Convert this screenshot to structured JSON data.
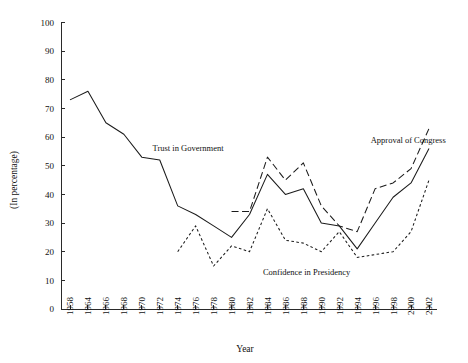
{
  "chart_data": {
    "type": "line",
    "title": "",
    "xlabel": "Year",
    "ylabel": "(In percentage)",
    "ylim": [
      0,
      100
    ],
    "ytick_step": 10,
    "grid": false,
    "legend_position": "inline-annotations",
    "yticks": [
      "0",
      "10",
      "20",
      "30",
      "40",
      "50",
      "60",
      "70",
      "80",
      "90",
      "100"
    ],
    "categories": [
      "1958",
      "1964",
      "1966",
      "1968",
      "1970",
      "1972",
      "1974",
      "1976",
      "1978",
      "1980",
      "1982",
      "1984",
      "1986",
      "1988",
      "1990",
      "1992",
      "1994",
      "1996",
      "1998",
      "2000",
      "2002"
    ],
    "series": [
      {
        "name": "Trust in Government",
        "style": "solid",
        "values": [
          73,
          76,
          65,
          61,
          53,
          52,
          36,
          33,
          29,
          25,
          33,
          47,
          40,
          42,
          30,
          29,
          21,
          30,
          39,
          44,
          56
        ],
        "label_x": 1971.2,
        "label_y": 55
      },
      {
        "name": "Confidence in Presidency",
        "style": "dotted",
        "values": [
          null,
          null,
          null,
          null,
          null,
          null,
          20,
          29,
          15,
          22,
          20,
          35,
          24,
          23,
          20,
          27,
          18,
          19,
          20,
          27,
          45
        ],
        "label_x": 1983.5,
        "label_y": 12
      },
      {
        "name": "Approval of Congress",
        "style": "dashed",
        "values": [
          null,
          null,
          null,
          null,
          null,
          null,
          null,
          null,
          null,
          34,
          34,
          53,
          45,
          51,
          36,
          29,
          27,
          42,
          44,
          49,
          63
        ],
        "label_x": 1995.5,
        "label_y": 58
      }
    ]
  },
  "axis": {
    "x_title": "Year",
    "y_title": "(In percentage)"
  }
}
